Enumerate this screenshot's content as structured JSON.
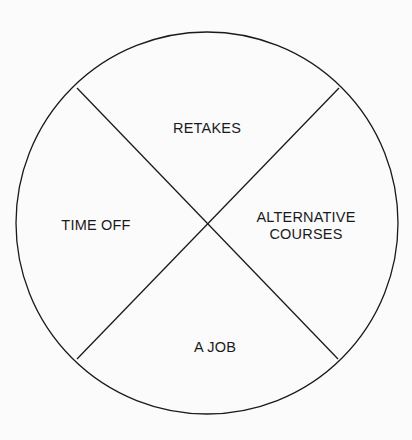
{
  "diagram": {
    "type": "divided-circle",
    "segments": [
      {
        "id": "top",
        "label": "RETAKES",
        "x": 207,
        "y": 128
      },
      {
        "id": "left",
        "label": "TIME OFF",
        "x": 96,
        "y": 225
      },
      {
        "id": "right",
        "label": "ALTERNATIVE COURSES",
        "line1": "ALTERNATIVE",
        "line2": "COURSES",
        "x": 306,
        "y": 226
      },
      {
        "id": "bottom",
        "label": "A JOB",
        "x": 215,
        "y": 347
      }
    ],
    "stroke_color": "#1a1a1a",
    "background": "#fbfbfb"
  }
}
